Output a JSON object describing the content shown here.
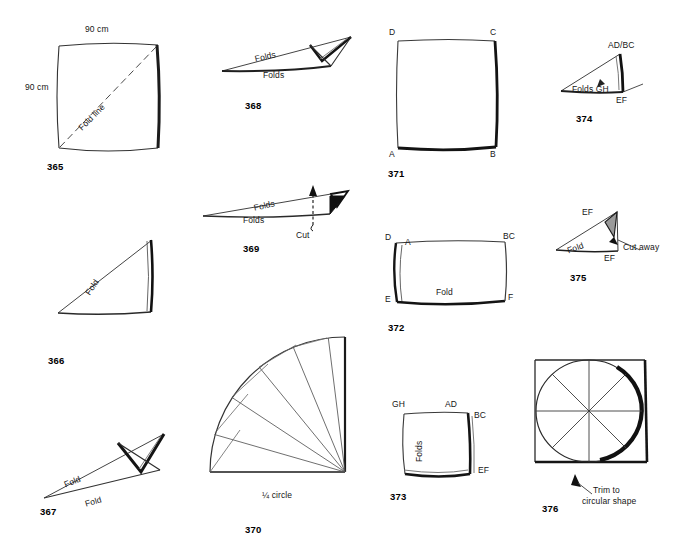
{
  "page": {
    "background": "#ffffff",
    "ink": "#161616",
    "shade": "#9a9a9a",
    "description": "Sheet of hand-drawn paper-folding instruction diagrams numbered 365 to 376"
  },
  "figures": [
    {
      "id": "365",
      "number": "365",
      "kind": "square-sheet-with-diagonal-fold-line",
      "labels": {
        "top": "90 cm",
        "left": "90 cm",
        "diagonal": "Fold line"
      }
    },
    {
      "id": "366",
      "number": "366",
      "kind": "folded-triangle",
      "labels": {
        "hypotenuse": "Fold"
      }
    },
    {
      "id": "367",
      "number": "367",
      "kind": "twice-folded-narrow-triangle",
      "labels": {
        "fold_upper": "Fold",
        "fold_lower": "Fold"
      }
    },
    {
      "id": "368",
      "number": "368",
      "kind": "thin-wedge-multiple-folds",
      "labels": {
        "folds_upper": "Folds",
        "folds_lower": "Folds"
      }
    },
    {
      "id": "369",
      "number": "369",
      "kind": "thin-wedge-with-cut-mark",
      "labels": {
        "folds_upper": "Folds",
        "folds_lower": "Folds",
        "cut": "Cut"
      }
    },
    {
      "id": "370",
      "number": "370",
      "kind": "quarter-circle-fan",
      "labels": {
        "caption": "¼ circle"
      },
      "fan": {
        "segments": 8,
        "start_angle_deg": 90,
        "end_angle_deg": 180
      }
    },
    {
      "id": "371",
      "number": "371",
      "kind": "square-corners-labelled",
      "labels": {
        "A": "A",
        "B": "B",
        "C": "C",
        "D": "D"
      }
    },
    {
      "id": "372",
      "number": "372",
      "kind": "rectangle-folded-once",
      "labels": {
        "D": "D",
        "A": "A",
        "BC": "BC",
        "E": "E",
        "F": "F",
        "fold": "Fold"
      }
    },
    {
      "id": "373",
      "number": "373",
      "kind": "square-folded-twice",
      "labels": {
        "GH": "GH",
        "AD": "AD",
        "BC": "BC",
        "EF": "EF",
        "folds": "Folds"
      }
    },
    {
      "id": "374",
      "number": "374",
      "kind": "triangle-folded-stack",
      "labels": {
        "ADBC": "AD/BC",
        "EF": "EF",
        "folds_gh": "Folds GH"
      }
    },
    {
      "id": "375",
      "number": "375",
      "kind": "triangle-with-cut-away-area",
      "labels": {
        "EF_top": "EF",
        "EF_bottom": "EF",
        "fold": "Fold",
        "cut_away": "Cut away"
      }
    },
    {
      "id": "376",
      "number": "376",
      "kind": "square-with-inscribed-circle",
      "labels": {
        "trim_line1": "Trim to",
        "trim_line2": "circular shape"
      }
    }
  ]
}
